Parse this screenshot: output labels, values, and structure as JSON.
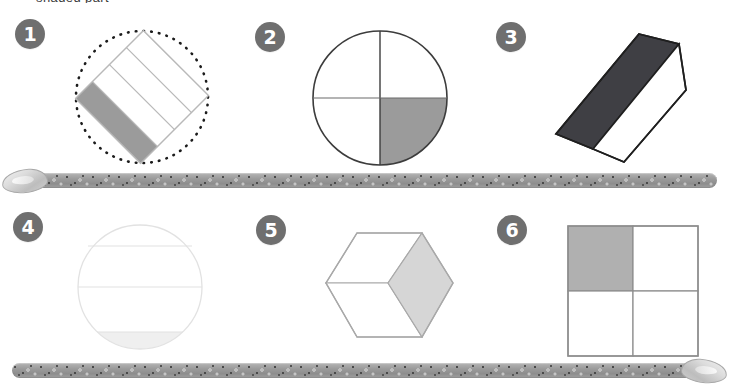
{
  "page": {
    "header_text": "shaded part",
    "background_color": "#ffffff"
  },
  "colors": {
    "badge_fill": "#6f6f6f",
    "badge_text": "#ffffff",
    "shade_medium": "#9b9b9b",
    "shade_dark": "#3f3f44",
    "shade_light": "#d6d6d6",
    "shade_very_light": "#efefef",
    "outline_dark": "#3c3c3c",
    "outline_light": "#b9b9b9",
    "outline_faint": "#e2e2e2",
    "divider_base": "#9a9a9a",
    "divider_speck": "#4a4a4a"
  },
  "problems": [
    {
      "number": "1",
      "shape": "rotated-rectangle-in-dotted-circle",
      "description": "Rotated rectangle divided into 4 equal vertical strips inside a dotted circle",
      "parts_total": 4,
      "parts_shaded": 1,
      "fraction": "1/4",
      "shade_color": "#9b9b9b",
      "outline_color": "#b9b9b9",
      "rotation_degrees": -45,
      "has_dotted_circle": true
    },
    {
      "number": "2",
      "shape": "circle-quarters",
      "description": "Circle divided into 4 quarters, bottom-right quarter shaded",
      "parts_total": 4,
      "parts_shaded": 1,
      "fraction": "1/4",
      "shaded_position": "bottom-right",
      "shade_color": "#9b9b9b",
      "outline_color": "#3c3c3c",
      "has_dotted_circle": false
    },
    {
      "number": "3",
      "shape": "hexagon-halves",
      "description": "Elongated tilted hexagon split lengthwise into 2 halves, upper-left half shaded dark",
      "parts_total": 2,
      "parts_shaded": 1,
      "fraction": "1/2",
      "shaded_position": "upper-left",
      "shade_color": "#3f3f44",
      "outline_color": "#1f1f1f",
      "rotation_degrees": -35,
      "has_dotted_circle": false
    },
    {
      "number": "4",
      "shape": "circle-horizontal-bands",
      "description": "Circle divided by two horizontal lines into 3 bands, bottom band faintly shaded",
      "parts_total": 3,
      "parts_shaded": 1,
      "fraction": "1/3",
      "shaded_position": "bottom",
      "shade_color": "#efefef",
      "outline_color": "#e2e2e2",
      "has_dotted_circle": false
    },
    {
      "number": "5",
      "shape": "hexagon-thirds-cube",
      "description": "Hexagon divided into 3 rhombi like a cube, right rhombus shaded light grey",
      "parts_total": 3,
      "parts_shaded": 1,
      "fraction": "1/3",
      "shaded_position": "right",
      "shade_color": "#d6d6d6",
      "outline_color": "#a9a9a9",
      "has_dotted_circle": false
    },
    {
      "number": "6",
      "shape": "square-quarters",
      "description": "Square divided into 4 equal quadrants, top-left quadrant shaded grey",
      "parts_total": 4,
      "parts_shaded": 1,
      "fraction": "1/4",
      "shaded_position": "top-left",
      "shade_color": "#b0b0b0",
      "outline_color": "#8d8d8d",
      "has_dotted_circle": false
    }
  ],
  "dividers": [
    {
      "id": "divider-row-1",
      "cap_side": "left"
    },
    {
      "id": "divider-row-2",
      "cap_side": "right"
    }
  ]
}
